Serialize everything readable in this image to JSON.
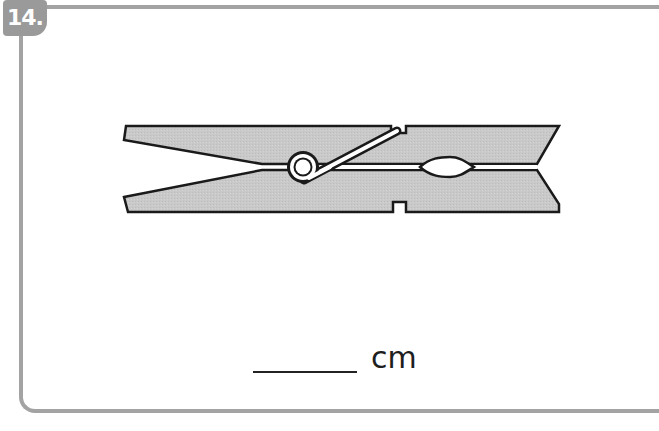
{
  "problem": {
    "number_label": "14.",
    "figure": {
      "subject": "clothespin",
      "icon": "clothespin-illustration",
      "fill_color": "#c8c8c8",
      "stroke_color": "#1a1a1a",
      "spring_color": "#ffffff"
    },
    "answer": {
      "blank_value": "",
      "unit": "cm"
    }
  },
  "colors": {
    "border": "#a3a3a3",
    "badge_bg": "#9a9a9a",
    "badge_text": "#ffffff",
    "text": "#1e1e1e"
  }
}
